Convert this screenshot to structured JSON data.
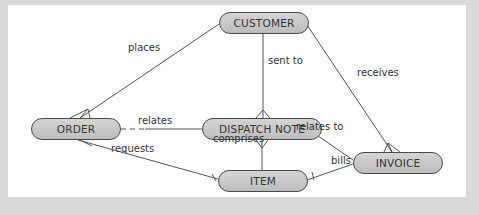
{
  "diagram": {
    "type": "entity-relationship",
    "colors": {
      "node_fill": "#c8c8c8",
      "node_border": "#4a4a4a",
      "line": "#555555",
      "background": "#ffffff",
      "frame": "#d9d9d9"
    },
    "entities": [
      {
        "id": "customer",
        "label": "CUSTOMER"
      },
      {
        "id": "order",
        "label": "ORDER"
      },
      {
        "id": "dispatch_note",
        "label": "DISPATCH NOTE"
      },
      {
        "id": "invoice",
        "label": "INVOICE"
      },
      {
        "id": "item",
        "label": "ITEM"
      }
    ],
    "relationships": [
      {
        "from": "customer",
        "to": "order",
        "label": "places"
      },
      {
        "from": "customer",
        "to": "dispatch_note",
        "label": "sent to"
      },
      {
        "from": "customer",
        "to": "invoice",
        "label": "receives"
      },
      {
        "from": "order",
        "to": "dispatch_note",
        "label": "relates"
      },
      {
        "from": "order",
        "to": "item",
        "label": "requests"
      },
      {
        "from": "dispatch_note",
        "to": "item",
        "label": "comprises"
      },
      {
        "from": "dispatch_note",
        "to": "invoice",
        "label": "relates to"
      },
      {
        "from": "invoice",
        "to": "item",
        "label": "bills"
      }
    ]
  }
}
